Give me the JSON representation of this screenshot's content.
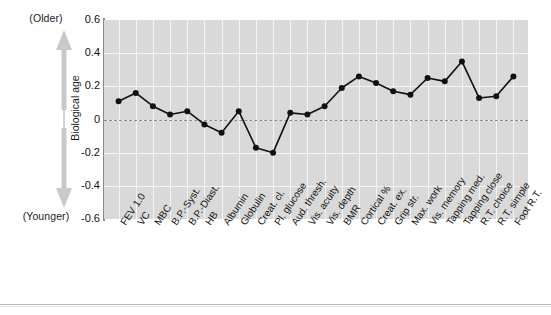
{
  "axis_annotation": {
    "top_label": "(Older)",
    "bottom_label": "(Younger)",
    "vertical_label": "Biological age",
    "arrow_icon": "double-headed-vertical-arrow"
  },
  "chart_data": {
    "type": "line",
    "title": "",
    "subtitle": "",
    "xlabel": "",
    "ylabel": "Biological age",
    "ylim": [
      -0.6,
      0.6
    ],
    "yticks": [
      "0.6",
      "0.4",
      "0.2",
      "0",
      "-0.2",
      "-0.4",
      "-0.6"
    ],
    "ytick_values": [
      0.6,
      0.4,
      0.2,
      0,
      -0.2,
      -0.4,
      -0.6
    ],
    "grid": true,
    "legend": "none",
    "reference_line": 0,
    "reference_line_style": "dashed",
    "marker": "filled-circle",
    "line_color": "#111111",
    "marker_color": "#111111",
    "plot_background": "#d9d9d9",
    "gridline_color": "#f4f4f4",
    "categories": [
      "FEV 1.0",
      "VC",
      "MBC",
      "B.P.-Syst.",
      "B.P.-Diast.",
      "HB",
      "Albumin",
      "Globulin",
      "Creat. cl.",
      "Pl. glucose",
      "Aud. thresh.",
      "Vis. acuity",
      "Vis. depth",
      "BMR",
      "Cortical %",
      "Creat. ex.",
      "Grip str.",
      "Max. work",
      "Vis. memory",
      "Tapping med.",
      "Tapping close",
      "R.T. choice",
      "R.T. simple",
      "Foot R.T."
    ],
    "values": [
      0.11,
      0.16,
      0.08,
      0.03,
      0.05,
      -0.03,
      -0.08,
      0.05,
      -0.17,
      -0.2,
      0.04,
      0.03,
      0.08,
      0.19,
      0.26,
      0.22,
      0.17,
      0.15,
      0.25,
      0.23,
      0.35,
      0.13,
      0.14,
      0.26
    ]
  }
}
